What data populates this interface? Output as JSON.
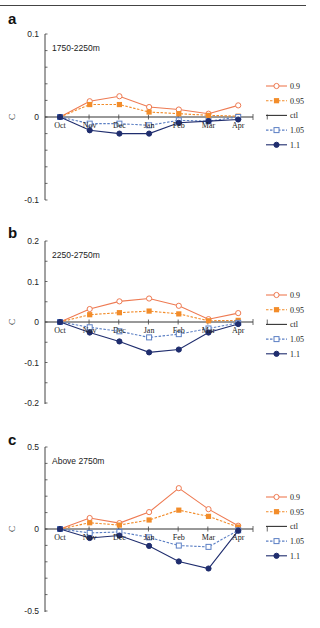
{
  "header": {
    "fragment": "… (…) … (… …)"
  },
  "colors": {
    "s09": "#ee7a52",
    "s095": "#f28c2a",
    "ctl": "#333333",
    "s105": "#5b7fc4",
    "s11": "#1f2d6e",
    "axis": "#444444"
  },
  "legend": [
    {
      "key": "s09",
      "label": "0.9",
      "marker": "open-circle",
      "dash": false
    },
    {
      "key": "s095",
      "label": "0.95",
      "marker": "filled-square",
      "dash": true
    },
    {
      "key": "ctl",
      "label": "ctl",
      "marker": "none",
      "dash": false
    },
    {
      "key": "s105",
      "label": "1.05",
      "marker": "open-square",
      "dash": true
    },
    {
      "key": "s11",
      "label": "1.1",
      "marker": "filled-circle",
      "dash": false
    }
  ],
  "chart_data": [
    {
      "type": "line",
      "panel": "a",
      "title": "1750-2250m",
      "xlabel": "",
      "ylabel": "C",
      "categories": [
        "Oct",
        "Nov",
        "Dec",
        "Jan",
        "Feb",
        "Mar",
        "Apr"
      ],
      "ylim": [
        -0.1,
        0.1
      ],
      "yticks_labeled": [
        0.1,
        0,
        -0.1
      ],
      "minor_tick_step": 0.02,
      "grid": false,
      "legend_position": "right",
      "series": [
        {
          "name": "0.9",
          "values": [
            0,
            0.019,
            0.025,
            0.012,
            0.009,
            0.004,
            0.014
          ]
        },
        {
          "name": "0.95",
          "values": [
            0,
            0.015,
            0.015,
            0.006,
            0.004,
            0.002,
            0.001
          ]
        },
        {
          "name": "ctl",
          "values": [
            0,
            0,
            0,
            0,
            0,
            0,
            0
          ]
        },
        {
          "name": "1.05",
          "values": [
            0,
            -0.008,
            -0.008,
            -0.01,
            -0.004,
            -0.005,
            0.0
          ]
        },
        {
          "name": "1.1",
          "values": [
            0,
            -0.016,
            -0.02,
            -0.02,
            -0.007,
            -0.005,
            -0.003
          ]
        }
      ]
    },
    {
      "type": "line",
      "panel": "b",
      "title": "2250-2750m",
      "xlabel": "",
      "ylabel": "C",
      "categories": [
        "Oct",
        "Nov",
        "Dec",
        "Jan",
        "Feb",
        "Mar",
        "Apr"
      ],
      "ylim": [
        -0.2,
        0.2
      ],
      "yticks_labeled": [
        0.2,
        0.1,
        0,
        -0.1,
        -0.2
      ],
      "minor_tick_step": 0.05,
      "grid": false,
      "legend_position": "right",
      "series": [
        {
          "name": "0.9",
          "values": [
            0,
            0.032,
            0.051,
            0.058,
            0.04,
            0.007,
            0.022
          ]
        },
        {
          "name": "0.95",
          "values": [
            0,
            0.018,
            0.023,
            0.027,
            0.02,
            0.003,
            0.004
          ]
        },
        {
          "name": "ctl",
          "values": [
            0,
            0,
            0,
            0,
            0,
            0,
            0
          ]
        },
        {
          "name": "1.05",
          "values": [
            0,
            -0.013,
            -0.023,
            -0.038,
            -0.03,
            -0.016,
            -0.002
          ]
        },
        {
          "name": "1.1",
          "values": [
            0,
            -0.026,
            -0.048,
            -0.075,
            -0.068,
            -0.026,
            -0.005
          ]
        }
      ]
    },
    {
      "type": "line",
      "panel": "c",
      "title": "Above 2750m",
      "xlabel": "",
      "ylabel": "C",
      "categories": [
        "Oct",
        "Nov",
        "Dec",
        "Jan",
        "Feb",
        "Mar",
        "Apr"
      ],
      "ylim": [
        -0.5,
        0.5
      ],
      "yticks_labeled": [
        0.5,
        0,
        -0.5
      ],
      "minor_tick_step": 0.1,
      "grid": false,
      "legend_position": "right",
      "series": [
        {
          "name": "0.9",
          "values": [
            0,
            0.067,
            0.036,
            0.103,
            0.249,
            0.121,
            0.02
          ]
        },
        {
          "name": "0.95",
          "values": [
            0,
            0.038,
            0.024,
            0.055,
            0.115,
            0.077,
            0.012
          ]
        },
        {
          "name": "ctl",
          "values": [
            0,
            0,
            0,
            0,
            0,
            0,
            0
          ]
        },
        {
          "name": "1.05",
          "values": [
            0,
            -0.024,
            -0.018,
            -0.051,
            -0.101,
            -0.109,
            -0.008
          ]
        },
        {
          "name": "1.1",
          "values": [
            0,
            -0.055,
            -0.04,
            -0.103,
            -0.198,
            -0.241,
            -0.01
          ]
        }
      ]
    }
  ],
  "layout": {
    "panels": [
      {
        "letter_y": 14,
        "top": 34,
        "bottom": 200,
        "zero": 117
      },
      {
        "letter_y": 228,
        "top": 241,
        "bottom": 404,
        "zero": 322
      },
      {
        "letter_y": 435,
        "top": 447,
        "bottom": 612,
        "zero": 529
      }
    ]
  }
}
